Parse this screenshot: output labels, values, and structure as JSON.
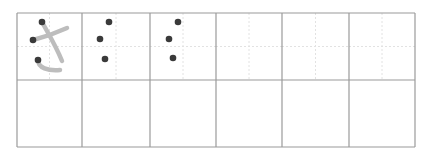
{
  "worksheet": {
    "character": "さ",
    "romaji": "sa",
    "grid": {
      "rows": 2,
      "cols": 6,
      "left": 17,
      "top": 13,
      "right": 415,
      "bottom": 147,
      "col_x": [
        17,
        82,
        150,
        216,
        282,
        349,
        415
      ],
      "row_y": [
        13,
        80,
        147
      ],
      "border_color": "#9a9a9a",
      "guide_color": "#e2e2e2"
    },
    "model_cell": {
      "stroke_color": "#bdbdbd",
      "dot_color": "#3a3a3a",
      "start_dots": [
        [
          42,
          22
        ],
        [
          33,
          40
        ],
        [
          38,
          60
        ]
      ]
    },
    "trace_cells": [
      {
        "dots": [
          [
            109,
            22
          ],
          [
            100,
            39
          ],
          [
            105,
            59
          ]
        ]
      },
      {
        "dots": [
          [
            178,
            22
          ],
          [
            169,
            39
          ],
          [
            173,
            58
          ]
        ]
      }
    ]
  }
}
